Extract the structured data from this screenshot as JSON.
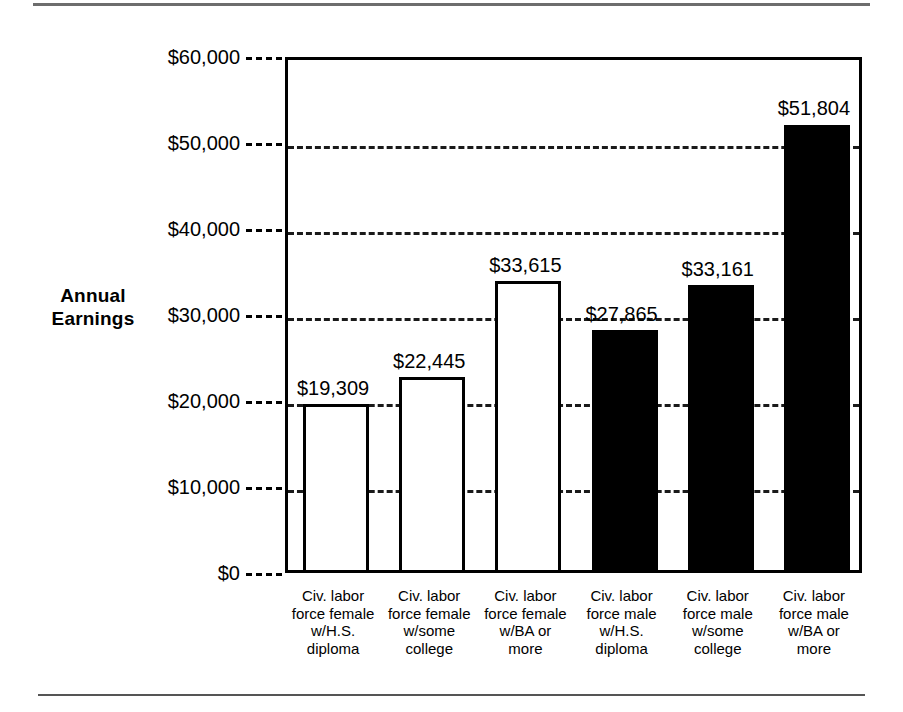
{
  "page": {
    "background_color": "#ffffff",
    "rule_color": "#6d6d6d"
  },
  "chart_data": {
    "type": "bar",
    "title": "",
    "subtitle": "",
    "xlabel": "",
    "ylabel": "Annual\nEarnings",
    "ylabel_line1": "Annual",
    "ylabel_line2": "Earnings",
    "ylim": [
      0,
      60000
    ],
    "ytick_values": [
      60000,
      50000,
      40000,
      30000,
      20000,
      10000,
      0
    ],
    "ytick_labels": [
      "$60,000",
      "$50,000",
      "$40,000",
      "$30,000",
      "$20,000",
      "$10,000",
      "$0"
    ],
    "grid": true,
    "grid_style": "dashed",
    "legend": "none",
    "categories": [
      "Civ. labor force female w/H.S. diploma",
      "Civ. labor force female w/some college",
      "Civ. labor force female w/BA or more",
      "Civ. labor force male w/H.S. diploma",
      "Civ. labor force male w/some college",
      "Civ. labor force male w/BA or more"
    ],
    "category_lines": [
      [
        "Civ. labor",
        "force female",
        "w/H.S.",
        "diploma"
      ],
      [
        "Civ. labor",
        "force female",
        "w/some",
        "college"
      ],
      [
        "Civ. labor",
        "force female",
        "w/BA or",
        "more"
      ],
      [
        "Civ. labor",
        "force male",
        "w/H.S.",
        "diploma"
      ],
      [
        "Civ. labor",
        "force male",
        "w/some",
        "college"
      ],
      [
        "Civ. labor",
        "force male",
        "w/BA or",
        "more"
      ]
    ],
    "values": [
      19309,
      22445,
      33615,
      27865,
      33161,
      51804
    ],
    "value_labels": [
      "$19,309",
      "$22,445",
      "$33,615",
      "$27,865",
      "$33,161",
      "$51,804"
    ],
    "bar_styles": [
      "open",
      "open",
      "open",
      "filled",
      "filled",
      "filled"
    ],
    "bar_fill_colors": [
      "#ffffff",
      "#ffffff",
      "#ffffff",
      "#000000",
      "#000000",
      "#000000"
    ],
    "bar_edge_color": "#000000"
  },
  "source": {
    "text": ""
  }
}
